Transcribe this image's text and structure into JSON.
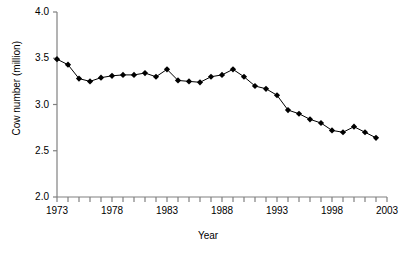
{
  "chart_data": {
    "type": "line",
    "title": "",
    "xlabel": "Year",
    "ylabel": "Cow number (million)",
    "xlim": [
      1973,
      2003
    ],
    "ylim": [
      2.0,
      4.0
    ],
    "grid": false,
    "legend": "none",
    "marker": "filled-diamond",
    "line_color": "#000000",
    "marker_color": "#000000",
    "axis_color": "#808080",
    "ytick_labels": [
      "4.0",
      "3.5",
      "3.0",
      "2.5",
      "2.0"
    ],
    "ytick_values": [
      4.0,
      3.5,
      3.0,
      2.5,
      2.0
    ],
    "xtick_labels": [
      "1973",
      "1978",
      "1983",
      "1988",
      "1993",
      "1998",
      "2003"
    ],
    "xtick_values": [
      1973,
      1978,
      1983,
      1988,
      1993,
      1998,
      2003
    ],
    "x": [
      1973,
      1974,
      1975,
      1976,
      1977,
      1978,
      1979,
      1980,
      1981,
      1982,
      1983,
      1984,
      1985,
      1986,
      1987,
      1988,
      1989,
      1990,
      1991,
      1992,
      1993,
      1994,
      1995,
      1996,
      1997,
      1998,
      1999,
      2000,
      2001,
      2002
    ],
    "values": [
      3.49,
      3.43,
      3.28,
      3.25,
      3.29,
      3.31,
      3.32,
      3.32,
      3.34,
      3.3,
      3.38,
      3.26,
      3.25,
      3.24,
      3.3,
      3.32,
      3.38,
      3.3,
      3.2,
      3.17,
      3.1,
      2.94,
      2.9,
      2.84,
      2.8,
      2.72,
      2.7,
      2.76,
      2.7,
      2.64
    ],
    "series_name": "Cow number"
  }
}
